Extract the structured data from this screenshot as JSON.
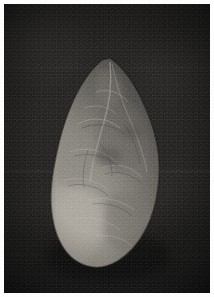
{
  "image": {
    "kind": "photograph",
    "subject": "stone handaxe artifact",
    "orientation": "vertical, tip up",
    "color_mode": "grayscale",
    "width_px": 214,
    "height_px": 297,
    "border": {
      "present": true,
      "color": "#fdfdfd",
      "width_px": 4
    },
    "background": {
      "description": "near-black studio backdrop with fine film grain",
      "base_color": "#161616",
      "highlight_color": "#23221f",
      "shadow_color": "#101010"
    },
    "artifact": {
      "label": "handaxe",
      "shape": "teardrop / ovate biface",
      "tip_position": {
        "x": 110,
        "y": 58
      },
      "base_position": {
        "x": 108,
        "y": 265
      },
      "widest_span": {
        "left_x": 55,
        "right_x": 158,
        "at_y": 190
      },
      "tone_dark": "#3d3b37",
      "tone_mid": "#6b6863",
      "tone_light": "#9a968e",
      "tone_highlight": "#b5b0a6",
      "surface_features": [
        "flake scars",
        "arris ridges",
        "cortex patch lower-left",
        "retouched lateral edges"
      ]
    },
    "artifact_regions": [
      {
        "name": "tip",
        "tone": "#6d6a64"
      },
      {
        "name": "upper-body",
        "tone": "#666360"
      },
      {
        "name": "mid-body",
        "tone": "#757269"
      },
      {
        "name": "lower-body",
        "tone": "#7d7a71"
      },
      {
        "name": "cortex-patch",
        "tone": "#9c988f"
      },
      {
        "name": "base",
        "tone": "#8a867d"
      }
    ]
  }
}
